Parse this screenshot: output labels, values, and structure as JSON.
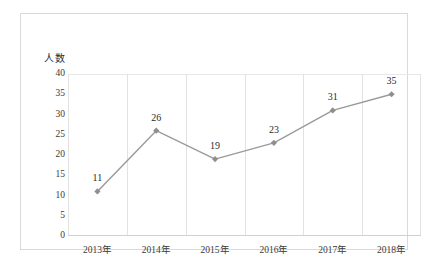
{
  "chart_data": {
    "type": "line",
    "title": "",
    "subtitle": "",
    "xlabel": "",
    "ylabel": "人数",
    "categories": [
      "2013年",
      "2014年",
      "2015年",
      "2016年",
      "2017年",
      "2018年"
    ],
    "values": [
      11,
      26,
      19,
      23,
      31,
      35
    ],
    "data_labels": [
      "11",
      "26",
      "19",
      "23",
      "31",
      "35"
    ],
    "ylim": [
      0,
      40
    ],
    "ytick_step": 5,
    "ytick_labels": [
      "40",
      "35",
      "30",
      "25",
      "20",
      "15",
      "10",
      "5",
      "0"
    ],
    "ytick_values": [
      40,
      35,
      30,
      25,
      20,
      15,
      10,
      5,
      0
    ],
    "grid": {
      "vertical": true,
      "horizontal": false
    },
    "legend": {
      "visible": false,
      "position": "none"
    },
    "series": [
      {
        "name": "人数",
        "values": [
          11,
          26,
          19,
          23,
          31,
          35
        ],
        "line_color": "#9a9a9a",
        "marker": "diamond",
        "marker_color": "#8f8f8f"
      }
    ],
    "colors": {
      "line": "#9a9a9a",
      "marker": "#8f8f8f",
      "gridline": "#e2e2e2",
      "frame_border": "#d9d9d9",
      "text": "#2b2b2b",
      "background": "#ffffff"
    }
  }
}
